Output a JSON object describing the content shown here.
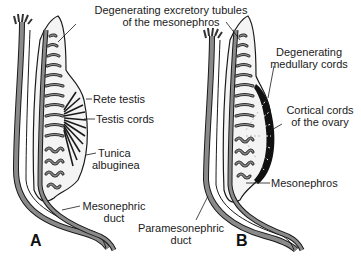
{
  "figure": {
    "panels": [
      {
        "id": "A",
        "letter": "A",
        "labels": {
          "degenerating_tubules_1": "Degenerating excretory tubules",
          "degenerating_tubules_2": "of the mesonephros",
          "rete_testis": "Rete testis",
          "testis_cords": "Testis cords",
          "tunica_1": "Tunica",
          "tunica_2": "albuginea",
          "mesonephric_duct_1": "Mesonephric",
          "mesonephric_duct_2": "duct"
        }
      },
      {
        "id": "B",
        "letter": "B",
        "labels": {
          "degenerating_medullary_1": "Degenerating",
          "degenerating_medullary_2": "medullary cords",
          "cortical_cords_1": "Cortical cords",
          "cortical_cords_2": "of the ovary",
          "mesonephros": "Mesonephros",
          "paramesonephric_duct_1": "Paramesonephric",
          "paramesonephric_duct_2": "duct"
        }
      }
    ],
    "colors": {
      "ink": "#1a1a1a",
      "duct_gray": "#8a8a8a",
      "tissue_fill": "#f4f4f4",
      "background": "#ffffff"
    }
  }
}
